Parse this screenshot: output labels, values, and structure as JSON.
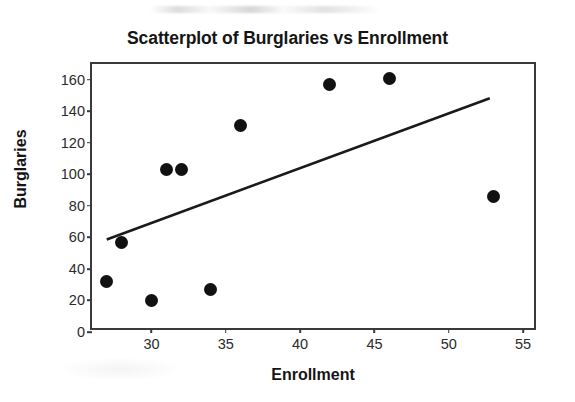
{
  "chart_data": {
    "type": "scatter",
    "title": "Scatterplot of Burglaries vs Enrollment",
    "xlabel": "Enrollment",
    "ylabel": "Burglaries",
    "xlim": [
      26,
      56
    ],
    "ylim": [
      0,
      170
    ],
    "xticks": [
      30,
      35,
      40,
      45,
      50,
      55
    ],
    "yticks": [
      0,
      20,
      40,
      60,
      80,
      100,
      120,
      140,
      160
    ],
    "grid": false,
    "legend": null,
    "marker_color": "#111111",
    "line_color": "#1a1a1a",
    "frame_color": "#3a3a3a",
    "points": [
      {
        "x": 27,
        "y": 32
      },
      {
        "x": 28,
        "y": 57
      },
      {
        "x": 30,
        "y": 20
      },
      {
        "x": 31,
        "y": 103
      },
      {
        "x": 32,
        "y": 103
      },
      {
        "x": 34,
        "y": 27
      },
      {
        "x": 36,
        "y": 131
      },
      {
        "x": 42,
        "y": 157
      },
      {
        "x": 46,
        "y": 161
      },
      {
        "x": 53,
        "y": 86
      }
    ],
    "fit_line": {
      "x1": 27,
      "y1": 57,
      "x2": 53,
      "y2": 148
    }
  }
}
